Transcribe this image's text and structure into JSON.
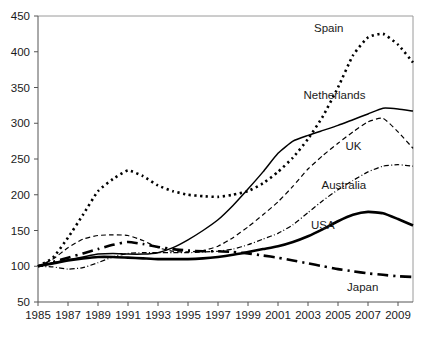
{
  "chart_data": {
    "type": "line",
    "title": "",
    "subtitle": "",
    "xlabel": "",
    "ylabel": "",
    "xlim": [
      1985,
      2010
    ],
    "ylim": [
      50,
      450
    ],
    "grid": false,
    "legend_position": "inline-labels",
    "x_tick_labels": [
      "1985",
      "1987",
      "1989",
      "1991",
      "1993",
      "1995",
      "1997",
      "1999",
      "2001",
      "2003",
      "2005",
      "2007",
      "2009"
    ],
    "x_ticks": [
      1985,
      1987,
      1989,
      1991,
      1993,
      1995,
      1997,
      1999,
      2001,
      2003,
      2005,
      2007,
      2009
    ],
    "y_tick_labels": [
      "50",
      "100",
      "150",
      "200",
      "250",
      "300",
      "350",
      "400",
      "450"
    ],
    "y_ticks": [
      50,
      100,
      150,
      200,
      250,
      300,
      350,
      400,
      450
    ],
    "x": [
      1985,
      1986,
      1987,
      1988,
      1989,
      1990,
      1991,
      1992,
      1993,
      1994,
      1995,
      1996,
      1997,
      1998,
      1999,
      2000,
      2001,
      2002,
      2003,
      2004,
      2005,
      2006,
      2007,
      2008,
      2009,
      2010
    ],
    "series": [
      {
        "name": "Spain",
        "label": "Spain",
        "style": "dotted",
        "color": "#000000",
        "width": 2.6,
        "values": [
          100,
          112,
          140,
          172,
          205,
          222,
          234,
          226,
          213,
          205,
          200,
          198,
          197,
          200,
          205,
          216,
          232,
          252,
          278,
          310,
          350,
          395,
          420,
          425,
          410,
          385
        ]
      },
      {
        "name": "Netherlands",
        "label": "Netherlands",
        "style": "solid",
        "color": "#000000",
        "width": 1.5,
        "values": [
          100,
          105,
          109,
          113,
          117,
          118,
          117,
          117,
          119,
          126,
          137,
          150,
          165,
          185,
          208,
          232,
          258,
          275,
          283,
          290,
          297,
          305,
          313,
          321,
          320,
          317
        ]
      },
      {
        "name": "UK",
        "label": "UK",
        "style": "dashed",
        "color": "#000000",
        "width": 1.2,
        "values": [
          100,
          110,
          126,
          138,
          143,
          144,
          143,
          136,
          126,
          121,
          120,
          122,
          128,
          140,
          155,
          172,
          190,
          212,
          236,
          255,
          272,
          288,
          302,
          307,
          288,
          265
        ]
      },
      {
        "name": "Australia",
        "label": "Australia",
        "style": "dashdot",
        "color": "#000000",
        "width": 1.2,
        "values": [
          100,
          99,
          96,
          98,
          105,
          113,
          118,
          119,
          119,
          119,
          119,
          120,
          121,
          124,
          130,
          138,
          146,
          158,
          175,
          192,
          207,
          220,
          232,
          240,
          242,
          240
        ]
      },
      {
        "name": "USA",
        "label": "USA",
        "style": "solid",
        "color": "#000000",
        "width": 2.6,
        "values": [
          100,
          104,
          108,
          111,
          113,
          113,
          112,
          111,
          110,
          110,
          110,
          111,
          113,
          116,
          120,
          124,
          128,
          134,
          142,
          152,
          163,
          172,
          176,
          174,
          166,
          157
        ]
      },
      {
        "name": "Japan",
        "label": "Japan",
        "style": "dashdot",
        "color": "#000000",
        "width": 2.6,
        "values": [
          100,
          106,
          112,
          118,
          124,
          130,
          134,
          131,
          127,
          124,
          122,
          121,
          121,
          120,
          118,
          115,
          112,
          108,
          104,
          100,
          96,
          93,
          90,
          88,
          86,
          85
        ]
      }
    ],
    "annotations": [
      {
        "text": "Spain",
        "x": 2003.4,
        "y": 428
      },
      {
        "text": "Netherlands",
        "x": 2002.7,
        "y": 334
      },
      {
        "text": "UK",
        "x": 2005.5,
        "y": 262
      },
      {
        "text": "Australia",
        "x": 2003.9,
        "y": 208
      },
      {
        "text": "USA",
        "x": 2003.2,
        "y": 152
      },
      {
        "text": "Japan",
        "x": 2005.6,
        "y": 66
      }
    ]
  },
  "colors": {
    "axis": "#555555",
    "frame": "#9a9a9a",
    "text": "#1a1a1a",
    "line": "#000000",
    "background": "#ffffff"
  }
}
